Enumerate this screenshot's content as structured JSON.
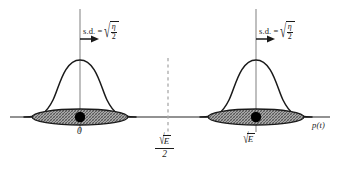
{
  "figure": {
    "background": "#ffffff",
    "axis_color": "#6e6e6e",
    "curve_color": "#1a1a1a",
    "ellipse_fill": "#9a9a9a",
    "dot_color": "#000000",
    "dashed_color": "#aaaaaa"
  },
  "axis": {
    "name": "p(t)",
    "label": "p(t)",
    "baseline_y": 117,
    "x_start": 10,
    "x_end": 330
  },
  "distributions": [
    {
      "id": "left",
      "mean_label": "0",
      "center_x": 80,
      "sd_text": "s.d. =",
      "sd_radicand_numerator": "η",
      "sd_radicand_denominator": "2",
      "sd_radical_sign": "√",
      "peak_height": 57,
      "arrow": "right-arrow"
    },
    {
      "id": "right",
      "mean_label": "E",
      "mean_radical_sign": "√",
      "center_x": 256,
      "sd_text": "s.d. =",
      "sd_radicand_numerator": "η",
      "sd_radicand_denominator": "2",
      "sd_radical_sign": "√",
      "peak_height": 57,
      "arrow": "right-arrow"
    }
  ],
  "threshold": {
    "id": "decision-threshold",
    "x": 168,
    "radical_sign": "√",
    "numerator_radicand": "E",
    "denominator": "2",
    "line_style": "dashed"
  }
}
